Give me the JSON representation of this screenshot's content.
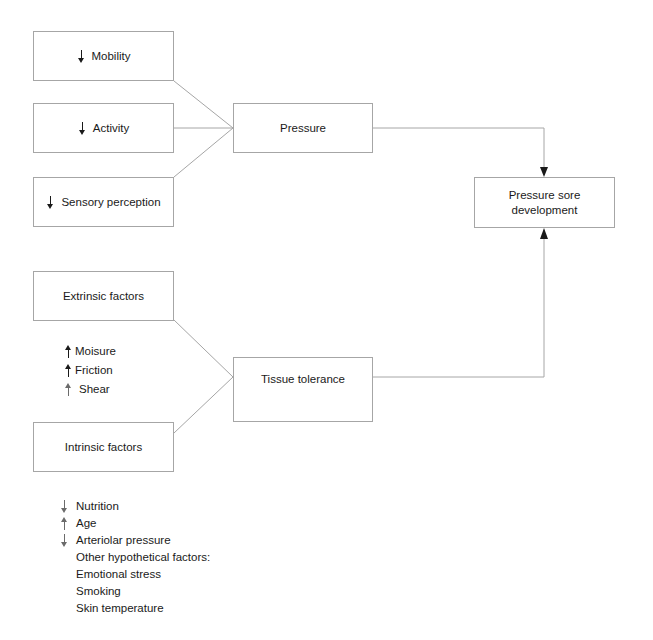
{
  "diagram": {
    "type": "flow-diagram",
    "line_color": "#a6a6a6",
    "text_color": "#1a1a1a",
    "background": "#ffffff",
    "nodes": [
      {
        "id": "mobility",
        "label": "Mobility",
        "marker": "down-arrow"
      },
      {
        "id": "activity",
        "label": "Activity",
        "marker": "down-arrow"
      },
      {
        "id": "sensory",
        "label": "Sensory perception",
        "marker": "down-arrow"
      },
      {
        "id": "pressure",
        "label": "Pressure",
        "marker": "none"
      },
      {
        "id": "extrinsic",
        "label": "Extrinsic factors",
        "marker": "none"
      },
      {
        "id": "intrinsic",
        "label": "Intrinsic factors",
        "marker": "none"
      },
      {
        "id": "tissue",
        "label": "Tissue tolerance",
        "marker": "none"
      },
      {
        "id": "outcome",
        "label": "Pressure sore\ndevelopment",
        "marker": "none"
      }
    ],
    "extrinsic_factors": [
      {
        "marker": "up-arrow",
        "label": "Moisure"
      },
      {
        "marker": "up-arrow",
        "label": "Friction"
      },
      {
        "marker": "up-arrow",
        "label": "Shear"
      }
    ],
    "intrinsic_factors": [
      {
        "marker": "down-arrow",
        "label": "Nutrition"
      },
      {
        "marker": "up-arrow",
        "label": "Age"
      },
      {
        "marker": "down-arrow",
        "label": "Arteriolar pressure"
      },
      {
        "marker": "none",
        "label": "Other hypothetical factors:"
      },
      {
        "marker": "none",
        "label": "Emotional stress"
      },
      {
        "marker": "none",
        "label": "Smoking"
      },
      {
        "marker": "none",
        "label": "Skin temperature"
      }
    ],
    "edges": [
      {
        "from": "mobility",
        "to": "pressure",
        "style": "diagonal",
        "arrowhead": false
      },
      {
        "from": "activity",
        "to": "pressure",
        "style": "straight",
        "arrowhead": false
      },
      {
        "from": "sensory",
        "to": "pressure",
        "style": "diagonal",
        "arrowhead": false
      },
      {
        "from": "extrinsic",
        "to": "tissue",
        "style": "diagonal",
        "arrowhead": false
      },
      {
        "from": "intrinsic",
        "to": "tissue",
        "style": "diagonal",
        "arrowhead": false
      },
      {
        "from": "pressure",
        "to": "outcome",
        "style": "orthogonal-down",
        "arrowhead": true
      },
      {
        "from": "tissue",
        "to": "outcome",
        "style": "orthogonal-up",
        "arrowhead": true
      }
    ]
  }
}
